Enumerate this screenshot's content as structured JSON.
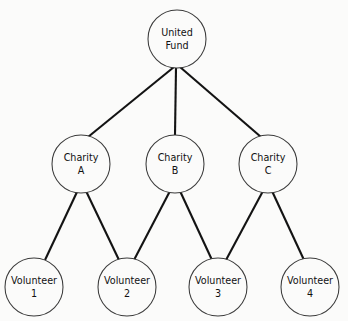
{
  "diagram": {
    "type": "hierarchical-tree",
    "title": "",
    "background_color": "#fbfbfa",
    "edge_color": "#131313",
    "node_stroke_color": "#3a3a3a",
    "node_fill_color": "#fbfbfa",
    "text_color": "#111111",
    "levels": [
      {
        "name": "root",
        "nodes": [
          {
            "id": "united-fund",
            "line1": "United",
            "line2": "Fund",
            "cx": 177,
            "cy": 39,
            "r": 29
          }
        ]
      },
      {
        "name": "charities",
        "nodes": [
          {
            "id": "charity-a",
            "line1": "Charity",
            "line2": "A",
            "cx": 81,
            "cy": 164,
            "r": 29
          },
          {
            "id": "charity-b",
            "line1": "Charity",
            "line2": "B",
            "cx": 175,
            "cy": 164,
            "r": 29
          },
          {
            "id": "charity-c",
            "line1": "Charity",
            "line2": "C",
            "cx": 268,
            "cy": 164,
            "r": 29
          }
        ]
      },
      {
        "name": "volunteers",
        "nodes": [
          {
            "id": "volunteer-1",
            "line1": "Volunteer",
            "line2": "1",
            "cx": 34,
            "cy": 287,
            "r": 29
          },
          {
            "id": "volunteer-2",
            "line1": "Volunteer",
            "line2": "2",
            "cx": 127,
            "cy": 287,
            "r": 29
          },
          {
            "id": "volunteer-3",
            "line1": "Volunteer",
            "line2": "3",
            "cx": 218,
            "cy": 287,
            "r": 29
          },
          {
            "id": "volunteer-4",
            "line1": "Volunteer",
            "line2": "4",
            "cx": 310,
            "cy": 287,
            "r": 29
          }
        ]
      }
    ],
    "edges": [
      {
        "id": "edge-united-fund-charity-a",
        "from": "united-fund",
        "to": "charity-a",
        "x1": 174,
        "y1": 67,
        "x2": 88,
        "y2": 137
      },
      {
        "id": "edge-united-fund-charity-b",
        "from": "united-fund",
        "to": "charity-b",
        "x1": 176,
        "y1": 68,
        "x2": 175,
        "y2": 135
      },
      {
        "id": "edge-united-fund-charity-c",
        "from": "united-fund",
        "to": "charity-c",
        "x1": 180,
        "y1": 67,
        "x2": 261,
        "y2": 137
      },
      {
        "id": "edge-charity-a-volunteer-1",
        "from": "charity-a",
        "to": "volunteer-1",
        "x1": 77,
        "y1": 192,
        "x2": 45,
        "y2": 260
      },
      {
        "id": "edge-charity-a-volunteer-2",
        "from": "charity-a",
        "to": "volunteer-2",
        "x1": 86,
        "y1": 191,
        "x2": 119,
        "y2": 260
      },
      {
        "id": "edge-charity-b-volunteer-2",
        "from": "charity-b",
        "to": "volunteer-2",
        "x1": 170,
        "y1": 191,
        "x2": 134,
        "y2": 260
      },
      {
        "id": "edge-charity-b-volunteer-3",
        "from": "charity-b",
        "to": "volunteer-3",
        "x1": 180,
        "y1": 191,
        "x2": 212,
        "y2": 260
      },
      {
        "id": "edge-charity-c-volunteer-3",
        "from": "charity-c",
        "to": "volunteer-3",
        "x1": 263,
        "y1": 191,
        "x2": 226,
        "y2": 260
      },
      {
        "id": "edge-charity-c-volunteer-4",
        "from": "charity-c",
        "to": "volunteer-4",
        "x1": 272,
        "y1": 191,
        "x2": 304,
        "y2": 260
      }
    ]
  }
}
